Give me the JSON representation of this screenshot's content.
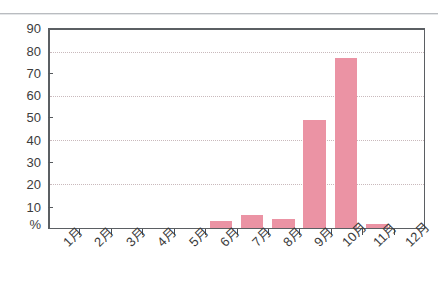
{
  "chart_data": {
    "type": "bar",
    "title": "",
    "xlabel": "",
    "ylabel": "%",
    "categories": [
      "1月",
      "2月",
      "3月",
      "4月",
      "5月",
      "6月",
      "7月",
      "8月",
      "9月",
      "10月",
      "11月",
      "12月"
    ],
    "values": [
      0,
      0,
      0,
      0,
      0,
      3,
      6,
      4,
      49,
      77,
      2,
      0
    ],
    "ylim": [
      0,
      90
    ],
    "yticks": [
      0,
      10,
      20,
      30,
      40,
      50,
      60,
      70,
      80,
      90
    ],
    "ytick_labels": [
      "%",
      "10",
      "20",
      "30",
      "40",
      "50",
      "60",
      "70",
      "80",
      "90"
    ],
    "gridlines_at": [
      20,
      40,
      60,
      80
    ],
    "grid": true,
    "legend": "none",
    "bar_color": "#eb93a4",
    "axis_color": "#55595d",
    "grid_color": "#c9b9bc"
  }
}
